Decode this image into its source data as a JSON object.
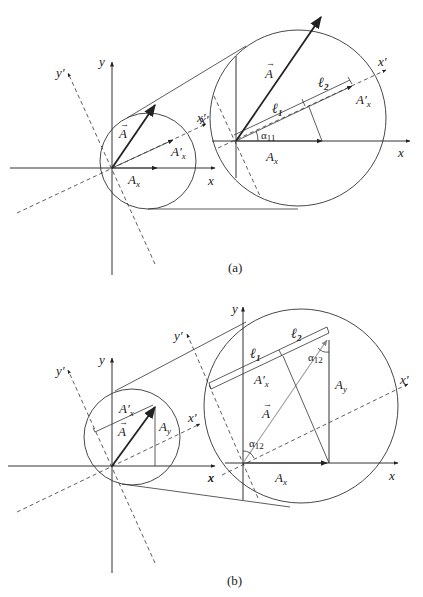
{
  "figure": {
    "panels": [
      {
        "id": "a",
        "caption": "(a)",
        "labels": {
          "x": "x",
          "y": "y",
          "x_prime": "x′",
          "y_prime": "y′",
          "vector_A": "A",
          "A_x": "A",
          "A_x_sub": "x",
          "A_x_prime": "A′",
          "A_x_prime_sub": "x",
          "l1": "ℓ",
          "l1_sub": "1",
          "l2": "ℓ",
          "l2_sub": "2",
          "alpha": "α",
          "alpha_sub": "11"
        }
      },
      {
        "id": "b",
        "caption": "(b)",
        "labels": {
          "x": "x",
          "y": "y",
          "x_prime": "x′",
          "y_prime": "y′",
          "vector_A": "A",
          "A_x": "A",
          "A_x_sub": "x",
          "A_y": "A",
          "A_y_sub": "y",
          "A_x_prime": "A′",
          "A_x_prime_sub": "x",
          "l1": "ℓ",
          "l1_sub": "1",
          "l2": "ℓ",
          "l2_sub": "2",
          "alpha": "α",
          "alpha_sub": "12"
        }
      }
    ]
  }
}
